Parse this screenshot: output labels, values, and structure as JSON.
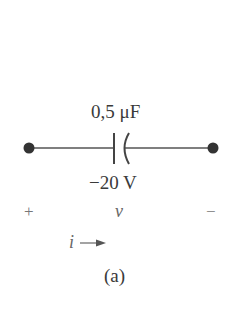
{
  "circuit": {
    "capacitance_label": "0,5 μF",
    "initial_voltage_label": "−20 V",
    "plus_sign": "+",
    "voltage_symbol": "v",
    "minus_sign": "−",
    "current_symbol": "i",
    "caption": "(a)"
  }
}
